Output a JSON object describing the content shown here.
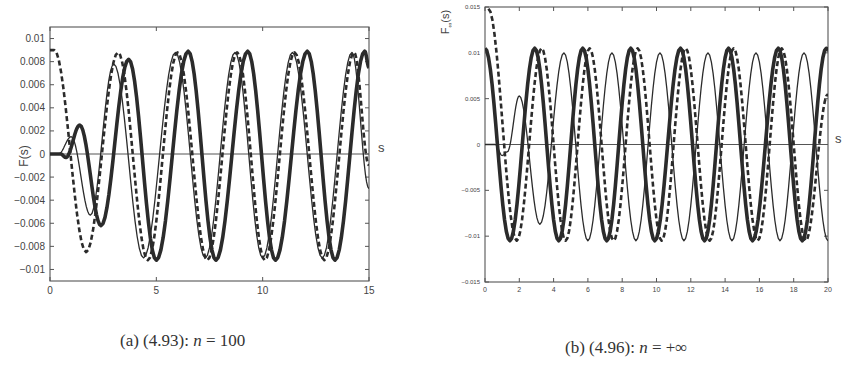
{
  "chart_data": [
    {
      "type": "line",
      "panel": "a",
      "caption": {
        "prefix": "(a) (4.93): ",
        "var": "n",
        "rest": " = 100"
      },
      "title": "",
      "xlabel": "s",
      "ylabel": "F(s)",
      "xlim": [
        0,
        15
      ],
      "ylim": [
        -0.011,
        0.011
      ],
      "xticks": [
        0,
        5,
        10,
        15
      ],
      "xtick_labels": [
        "0",
        "5",
        "10",
        "15"
      ],
      "yticks": [
        0.01,
        0.008,
        0.006,
        0.004,
        0.002,
        0,
        -0.002,
        -0.004,
        -0.006,
        -0.008,
        -0.01
      ],
      "ytick_labels": [
        "0.01",
        "0.008",
        "0.006",
        "0.004",
        "0.002",
        "0",
        "-0.002",
        "-0.004",
        "-0.006",
        "-0.008",
        "-0.01"
      ],
      "grid": false,
      "legend": null,
      "series": [
        {
          "name": "thin solid",
          "style": "thin",
          "points": [
            [
              0,
              0
            ],
            [
              0.4,
              0
            ],
            [
              1.0,
              0.0015
            ],
            [
              1.9,
              -0.0053
            ],
            [
              3.0,
              0.0078
            ],
            [
              4.4,
              -0.009
            ],
            [
              5.9,
              0.0088
            ],
            [
              7.3,
              -0.009
            ],
            [
              8.7,
              0.0088
            ],
            [
              10.0,
              -0.009
            ],
            [
              11.4,
              0.0088
            ],
            [
              12.8,
              -0.009
            ],
            [
              14.2,
              0.0088
            ],
            [
              15.0,
              -0.003
            ]
          ]
        },
        {
          "name": "dashed",
          "style": "dashed",
          "points": [
            [
              0,
              0.009
            ],
            [
              0.2,
              0.009
            ],
            [
              1.7,
              -0.0085
            ],
            [
              3.2,
              0.0088
            ],
            [
              4.6,
              -0.0092
            ],
            [
              6.0,
              0.0088
            ],
            [
              7.4,
              -0.0092
            ],
            [
              8.8,
              0.0088
            ],
            [
              10.1,
              -0.0092
            ],
            [
              11.5,
              0.0088
            ],
            [
              12.9,
              -0.0092
            ],
            [
              14.3,
              0.0088
            ],
            [
              15.0,
              -0.001
            ]
          ]
        },
        {
          "name": "thick solid",
          "style": "thick",
          "points": [
            [
              0,
              0
            ],
            [
              0.5,
              0
            ],
            [
              0.75,
              -0.0003
            ],
            [
              1.4,
              0.0025
            ],
            [
              2.4,
              -0.0062
            ],
            [
              3.7,
              0.0082
            ],
            [
              5.0,
              -0.0092
            ],
            [
              6.5,
              0.0089
            ],
            [
              7.8,
              -0.0092
            ],
            [
              9.3,
              0.0089
            ],
            [
              10.6,
              -0.0092
            ],
            [
              12.1,
              0.0089
            ],
            [
              13.4,
              -0.0092
            ],
            [
              14.8,
              0.0089
            ],
            [
              15.0,
              0.0075
            ]
          ]
        }
      ]
    },
    {
      "type": "line",
      "panel": "b",
      "caption": {
        "prefix": "(b) (4.96): ",
        "var": "n",
        "rest": " = +∞"
      },
      "title": "",
      "xlabel": "s",
      "ylabel": "F∞(s)",
      "xlim": [
        0,
        20
      ],
      "ylim": [
        -0.015,
        0.015
      ],
      "xticks": [
        0,
        2,
        4,
        6,
        8,
        10,
        12,
        14,
        16,
        18,
        20
      ],
      "xtick_labels": [
        "0",
        "2",
        "4",
        "6",
        "8",
        "10",
        "12",
        "14",
        "16",
        "18",
        "20"
      ],
      "yticks": [
        0.015,
        0.01,
        0.005,
        0,
        -0.005,
        -0.01,
        -0.015
      ],
      "ytick_labels": [
        "0.015",
        "0.01",
        "0.005",
        "0",
        "-0.005",
        "-0.01",
        "-0.015"
      ],
      "grid": false,
      "legend": null,
      "series": [
        {
          "name": "thin solid",
          "style": "thin",
          "points": [
            [
              0,
              0
            ],
            [
              0.6,
              0
            ],
            [
              1.0,
              -0.0012
            ],
            [
              1.3,
              -0.0008
            ],
            [
              2.0,
              0.0053
            ],
            [
              3.2,
              -0.0087
            ],
            [
              4.6,
              0.01
            ],
            [
              6.0,
              -0.0105
            ],
            [
              7.4,
              0.01
            ],
            [
              8.8,
              -0.0105
            ],
            [
              10.2,
              0.01
            ],
            [
              11.6,
              -0.0105
            ],
            [
              13.0,
              0.01
            ],
            [
              14.4,
              -0.0105
            ],
            [
              15.8,
              0.01
            ],
            [
              17.2,
              -0.0105
            ],
            [
              18.6,
              0.01
            ],
            [
              20.0,
              -0.0105
            ]
          ]
        },
        {
          "name": "dashed",
          "style": "dashed",
          "points": [
            [
              0.2,
              0.0148
            ],
            [
              1.85,
              -0.0105
            ],
            [
              3.3,
              0.0105
            ],
            [
              4.7,
              -0.0105
            ],
            [
              6.1,
              0.0105
            ],
            [
              7.5,
              -0.0105
            ],
            [
              8.9,
              0.0105
            ],
            [
              10.3,
              -0.0105
            ],
            [
              11.7,
              0.0105
            ],
            [
              13.1,
              -0.0105
            ],
            [
              14.5,
              0.0105
            ],
            [
              15.9,
              -0.0105
            ],
            [
              17.3,
              0.0105
            ],
            [
              18.7,
              -0.0105
            ],
            [
              20.0,
              0.0055
            ]
          ]
        },
        {
          "name": "thick solid",
          "style": "thick",
          "points": [
            [
              0,
              0.0105
            ],
            [
              1.45,
              -0.0105
            ],
            [
              2.9,
              0.0105
            ],
            [
              4.3,
              -0.0105
            ],
            [
              5.7,
              0.0105
            ],
            [
              7.1,
              -0.0105
            ],
            [
              8.5,
              0.0105
            ],
            [
              9.9,
              -0.0105
            ],
            [
              11.4,
              0.0105
            ],
            [
              12.8,
              -0.0105
            ],
            [
              14.2,
              0.0105
            ],
            [
              15.6,
              -0.0105
            ],
            [
              17.1,
              0.0105
            ],
            [
              18.5,
              -0.0105
            ],
            [
              19.9,
              0.0105
            ],
            [
              20.0,
              0.0103
            ]
          ]
        }
      ]
    }
  ],
  "captions": {
    "a_prefix": "(a) (4.93): ",
    "a_var": "n",
    "a_rest": " = 100",
    "b_prefix": "(b) (4.96): ",
    "b_var": "n",
    "b_rest": " = +∞"
  },
  "colors": {
    "line": "#2b2b2b",
    "axis": "#555555",
    "text": "#444444"
  }
}
